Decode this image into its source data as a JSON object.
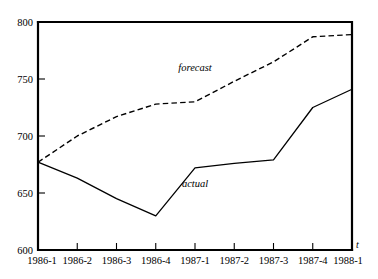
{
  "figure": {
    "top_caption": "",
    "background": "#ffffff",
    "line_color": "#000000"
  },
  "chart_data": {
    "type": "line",
    "title": "",
    "xlabel": "t",
    "ylabel": "",
    "ylim": [
      600,
      800
    ],
    "yticks": [
      600,
      650,
      700,
      750,
      800
    ],
    "ytick_labels": [
      "600",
      "650",
      "700",
      "750",
      "800"
    ],
    "grid": false,
    "legend": "inline-annotations",
    "categories": [
      "1986-1",
      "1986-2",
      "1986-3",
      "1986-4",
      "1987-1",
      "1987-2",
      "1987-3",
      "1987-4",
      "1988-1"
    ],
    "series": [
      {
        "name": "actual",
        "style": "solid",
        "label_text": "actual",
        "label_at_category": "1987-1",
        "label_value": 655,
        "values": [
          677,
          663,
          645,
          630,
          672,
          676,
          679,
          725,
          741
        ]
      },
      {
        "name": "forecast",
        "style": "dashed",
        "label_text": "forecast",
        "label_at_category": "1987-1",
        "label_value": 757,
        "values": [
          677,
          700,
          717,
          728,
          730,
          748,
          765,
          787,
          789
        ]
      }
    ]
  }
}
